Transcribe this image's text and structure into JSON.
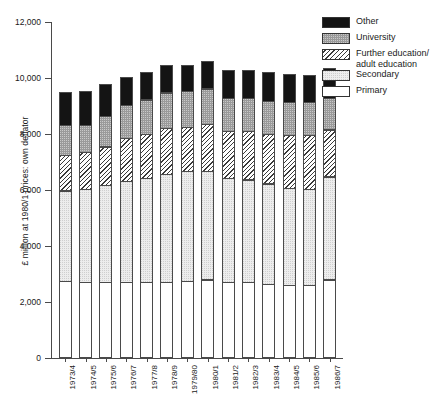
{
  "chart_data": {
    "type": "bar",
    "subtype": "stacked",
    "title": "",
    "xlabel": "",
    "ylabel": "£ million at 1980/1 prices: own deflator",
    "ylim": [
      0,
      12000
    ],
    "ytick_values": [
      0,
      2000,
      4000,
      6000,
      8000,
      10000,
      12000
    ],
    "ytick_labels": [
      "0",
      "2,000",
      "4,000",
      "6,000",
      "8,000",
      "10,000",
      "12,000"
    ],
    "grid": false,
    "legend_position": "top-right",
    "categories": [
      "1973/4",
      "1974/5",
      "1975/6",
      "1976/7",
      "1977/8",
      "1978/9",
      "1979/80",
      "1980/1",
      "1981/2",
      "1982/3",
      "1983/4",
      "1984/5",
      "1985/6",
      "1986/7"
    ],
    "series": [
      {
        "name": "Primary",
        "color": "#ffffff",
        "pattern": "solid-white",
        "values": [
          2750,
          2700,
          2700,
          2700,
          2700,
          2700,
          2750,
          2800,
          2700,
          2700,
          2650,
          2600,
          2600,
          2800
        ]
      },
      {
        "name": "Secondary",
        "color": "#ededed",
        "pattern": "fine-dot",
        "values": [
          3250,
          3350,
          3500,
          3650,
          3750,
          3900,
          3950,
          3900,
          3750,
          3700,
          3600,
          3500,
          3450,
          3700
        ]
      },
      {
        "name": "Further education/\nadult education",
        "color": "#ffffff",
        "pattern": "diagonal-hatch",
        "values": [
          1300,
          1350,
          1400,
          1550,
          1600,
          1650,
          1600,
          1700,
          1700,
          1750,
          1800,
          1900,
          1950,
          1700
        ]
      },
      {
        "name": "University",
        "color": "#9a9a9a",
        "pattern": "coarse-dot",
        "values": [
          1100,
          1000,
          1100,
          1200,
          1250,
          1300,
          1300,
          1300,
          1200,
          1200,
          1200,
          1200,
          1200,
          1150
        ]
      },
      {
        "name": "Other",
        "color": "#141414",
        "pattern": "solid-black",
        "values": [
          1200,
          1250,
          1200,
          1050,
          1000,
          1000,
          950,
          1000,
          1050,
          1050,
          1050,
          1050,
          1000,
          1100
        ]
      }
    ],
    "totals": [
      9600,
      9650,
      9900,
      10150,
      10300,
      10550,
      10550,
      10700,
      10400,
      10400,
      10300,
      10250,
      10200,
      10450
    ]
  }
}
